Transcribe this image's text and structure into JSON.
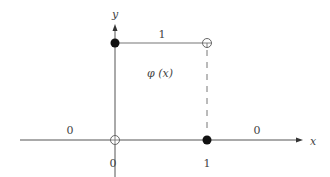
{
  "figure": {
    "type": "step-function-diagram",
    "function_label": "φ (x)",
    "axes": {
      "x_label": "x",
      "y_label": "y"
    },
    "tick_labels": {
      "origin": "0",
      "one": "1"
    },
    "segment_values": {
      "left": "0",
      "middle": "1",
      "right": "0"
    },
    "colors": {
      "line": "#6b6b6b",
      "axis": "#444444",
      "filled_dot": "#111111",
      "text": "#444444"
    },
    "points": [
      {
        "name": "filled-top-left",
        "x": 0,
        "y": 1,
        "filled": true
      },
      {
        "name": "open-top-right",
        "x": 1,
        "y": 1,
        "filled": false
      },
      {
        "name": "open-origin",
        "x": 0,
        "y": 0,
        "filled": false
      },
      {
        "name": "filled-bottom-right",
        "x": 1,
        "y": 0,
        "filled": true
      }
    ]
  }
}
